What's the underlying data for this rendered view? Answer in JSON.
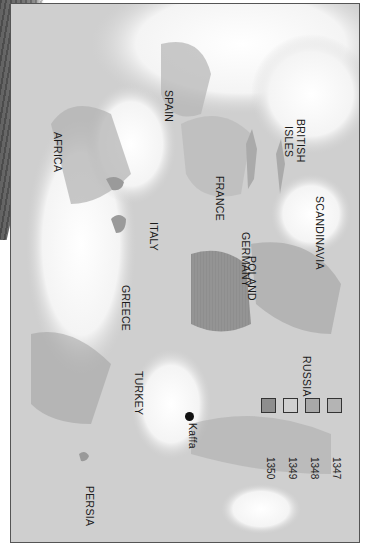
{
  "map": {
    "orientation": "rotated 90 degrees clockwise",
    "regions": [
      {
        "id": "africa",
        "label": "AFRICA"
      },
      {
        "id": "spain",
        "label": "SPAIN"
      },
      {
        "id": "france",
        "label": "FRANCE"
      },
      {
        "id": "british-isles",
        "label_line1": "BRITISH",
        "label_line2": "ISLES"
      },
      {
        "id": "scandinavia",
        "label": "SCANDINAVIA"
      },
      {
        "id": "germany",
        "label": "GERMANY"
      },
      {
        "id": "italy",
        "label": "ITALY"
      },
      {
        "id": "poland",
        "label": "POLAND"
      },
      {
        "id": "greece",
        "label": "GREECE"
      },
      {
        "id": "russia",
        "label": "RUSSIA"
      },
      {
        "id": "turkey",
        "label": "TURKEY"
      },
      {
        "id": "persia",
        "label": "PERSIA"
      }
    ],
    "city": {
      "label": "Kaffa"
    }
  },
  "legend": {
    "items": [
      {
        "year": "1347",
        "color": "#b4b4b4"
      },
      {
        "year": "1348",
        "color": "#a8a8a8"
      },
      {
        "year": "1349",
        "color": "#d0d0d0"
      },
      {
        "year": "1350",
        "color": "#8e8e8e"
      }
    ]
  }
}
